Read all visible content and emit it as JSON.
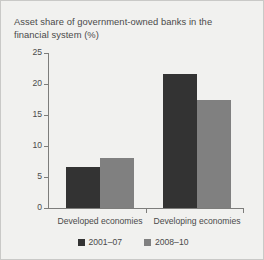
{
  "chart_data": {
    "type": "bar",
    "title": "Asset share of government-owned banks in the financial system (%)",
    "xlabel": "",
    "ylabel": "",
    "ylim": [
      0,
      25
    ],
    "yticks": [
      0,
      5,
      10,
      15,
      20,
      25
    ],
    "ytick_labels": [
      "0",
      "5",
      "10",
      "15",
      "20",
      "25"
    ],
    "grid": false,
    "legend_position": "bottom-center",
    "categories": [
      "Developed economies",
      "Developing economies"
    ],
    "series": [
      {
        "name": "2001–07",
        "color": "#333333",
        "values": [
          6.6,
          21.6
        ]
      },
      {
        "name": "2008–10",
        "color": "#808080",
        "values": [
          8.1,
          17.4
        ]
      }
    ]
  },
  "figure": {
    "background": "#f1f1ef",
    "border_color": "#c9c9c7",
    "axis_color": "#7d7d7b",
    "text_color": "#4a4a4a"
  }
}
